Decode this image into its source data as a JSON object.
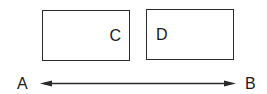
{
  "diagram": {
    "boxes": [
      {
        "id": "C",
        "label": "C"
      },
      {
        "id": "D",
        "label": "D"
      }
    ],
    "arrow": {
      "from": "A",
      "to": "B",
      "direction": "bidirectional",
      "start_label": "A",
      "end_label": "B"
    },
    "colors": {
      "stroke": "#2a2a2a",
      "text": "#1a1a1a",
      "background": "#ffffff"
    }
  }
}
